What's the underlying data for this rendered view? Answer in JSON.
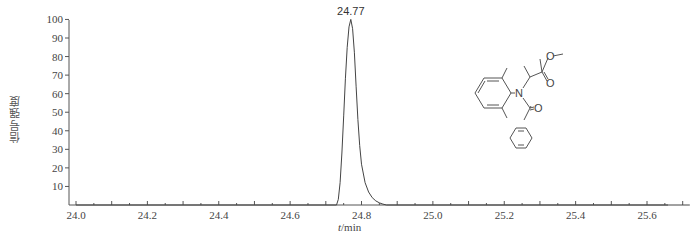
{
  "chart_data": {
    "type": "line",
    "title": "",
    "xlabel": "t/min",
    "xlabel_var": "t",
    "xlabel_unit": "/min",
    "ylabel": "信号强度",
    "xlim": [
      24.0,
      25.72
    ],
    "ylim": [
      0,
      100
    ],
    "x_ticks": [
      "24.0",
      "24.2",
      "24.4",
      "24.6",
      "24.8",
      "25.0",
      "25.2",
      "25.4",
      "25.6"
    ],
    "y_ticks": [
      "10",
      "20",
      "30",
      "40",
      "50",
      "60",
      "70",
      "80",
      "90",
      "100"
    ],
    "grid": false,
    "legend": null,
    "annotations": [
      {
        "text": "24.77",
        "x": 24.77,
        "y": 100
      }
    ],
    "series": [
      {
        "name": "chromatogram",
        "x": [
          24.0,
          24.73,
          24.735,
          24.74,
          24.745,
          24.75,
          24.755,
          24.76,
          24.765,
          24.77,
          24.775,
          24.78,
          24.785,
          24.79,
          24.795,
          24.8,
          24.81,
          24.82,
          24.83,
          24.84,
          24.85,
          24.86,
          24.87,
          25.72
        ],
        "y": [
          0,
          0,
          3,
          12,
          28,
          48,
          68,
          85,
          96,
          100,
          95,
          82,
          64,
          46,
          32,
          22,
          12,
          7,
          4,
          2.2,
          1.2,
          0.5,
          0,
          0
        ]
      }
    ],
    "inset": {
      "type": "chemical-structure",
      "atoms_labeled": [
        "O",
        "O",
        "N",
        "O"
      ]
    }
  }
}
